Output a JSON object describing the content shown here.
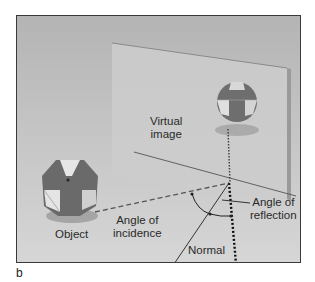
{
  "figure": {
    "panel_letter": "b",
    "labels": {
      "virtual_image_line1": "Virtual",
      "virtual_image_line2": "image",
      "object": "Object",
      "angle_incidence_line1": "Angle of",
      "angle_incidence_line2": "incidence",
      "angle_reflection_line1": "Angle of",
      "angle_reflection_line2": "reflection",
      "normal": "Normal"
    },
    "colors": {
      "background_top": "#b4b4b4",
      "background_bottom": "#d6d6d6",
      "mirror": "#cfcfcf",
      "frame": "#3a3a3a",
      "polyhedron_dark": "#6e6e6e",
      "polyhedron_light": "#e2e2e2"
    }
  }
}
